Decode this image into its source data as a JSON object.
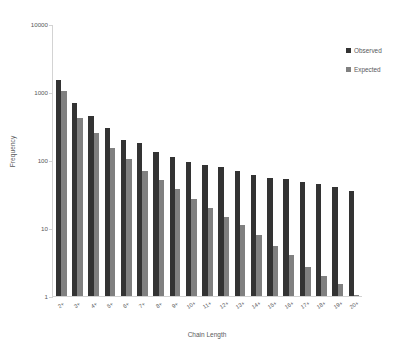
{
  "chart_data": {
    "type": "bar",
    "title": "",
    "xlabel": "Chain Length",
    "ylabel": "Frequency",
    "yscale": "log",
    "ylim": [
      1,
      10000
    ],
    "ytick_labels": [
      "10000",
      "1000",
      "100",
      "10",
      "1"
    ],
    "ytick_values": [
      10000,
      1000,
      100,
      10,
      1
    ],
    "grid": false,
    "legend_position": "right",
    "categories": [
      "2+",
      "3+",
      "4+",
      "5+",
      "6+",
      "7+",
      "8+",
      "9+",
      "10+",
      "11+",
      "12+",
      "13+",
      "14+",
      "15+",
      "16+",
      "17+",
      "18+",
      "19+",
      "20+"
    ],
    "series": [
      {
        "name": "Observed",
        "color": "#333333",
        "values": [
          1500,
          700,
          440,
          300,
          200,
          180,
          130,
          110,
          95,
          85,
          78,
          70,
          60,
          55,
          52,
          48,
          44,
          40,
          35
        ]
      },
      {
        "name": "Expected",
        "color": "#808080",
        "values": [
          1050,
          420,
          250,
          150,
          105,
          70,
          50,
          37,
          27,
          20,
          14.5,
          11,
          8,
          5.5,
          4,
          2.7,
          2,
          1.5,
          1
        ]
      }
    ]
  },
  "legend": {
    "items": [
      {
        "label": "Observed",
        "swatch": "observed-swatch"
      },
      {
        "label": "Expected",
        "swatch": "expected-swatch"
      }
    ]
  },
  "axes": {
    "x_title": "Chain Length",
    "y_title": "Frequency"
  }
}
